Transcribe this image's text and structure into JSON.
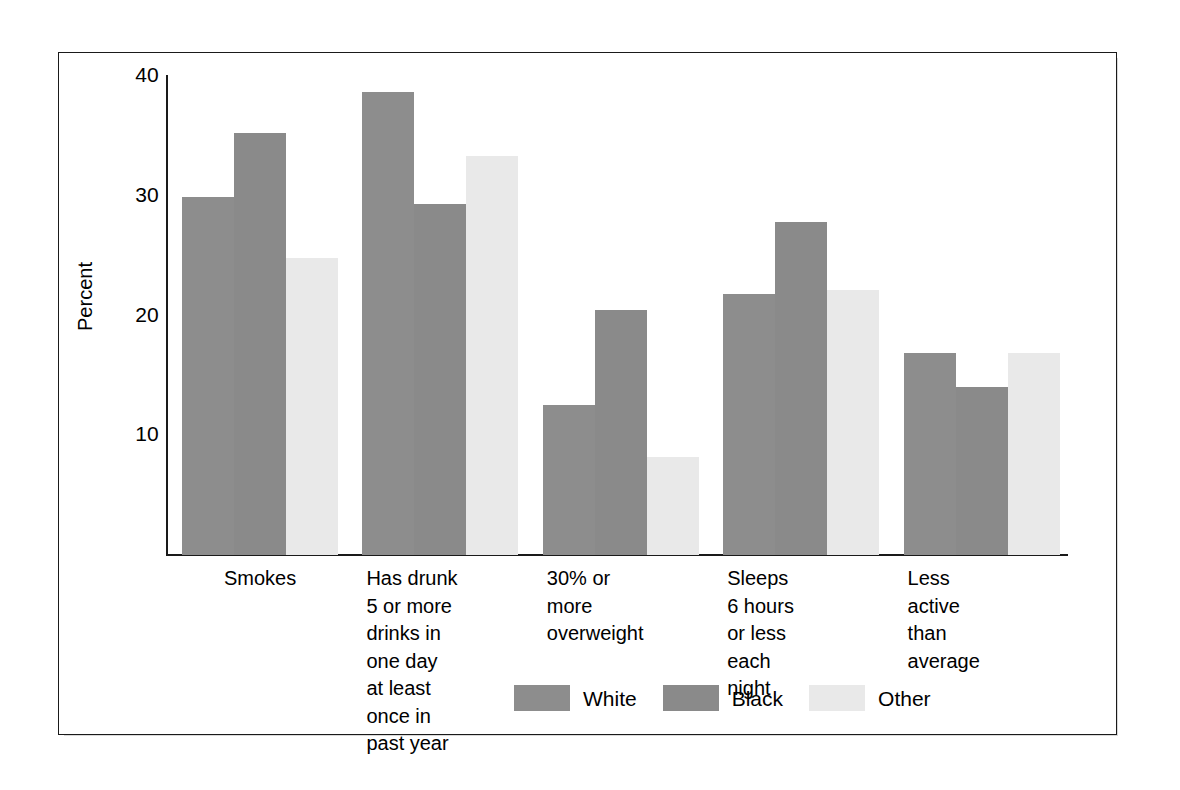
{
  "chart_data": {
    "type": "bar",
    "title": "",
    "subtitle": "",
    "xlabel": "",
    "ylabel": "Percent",
    "ylim": [
      0,
      40
    ],
    "yticks": [
      10,
      20,
      30,
      40
    ],
    "grid": false,
    "legend_position": "bottom-center",
    "categories": [
      "Smokes",
      "Has drunk\n5 or more\ndrinks in\none day\nat least\nonce in\npast year",
      "30% or\nmore\noverweight",
      "Sleeps\n6 hours\nor less\neach\nnight",
      "Less\nactive\nthan\naverage"
    ],
    "series": [
      {
        "name": "White",
        "color": "#8d8d8d",
        "values": [
          29.9,
          38.7,
          12.5,
          21.8,
          16.9
        ]
      },
      {
        "name": "Black",
        "color": "#8a8a8a",
        "values": [
          35.2,
          29.3,
          20.5,
          27.8,
          14.0
        ]
      },
      {
        "name": "Other",
        "color": "#e9e9e9",
        "values": [
          24.8,
          33.3,
          8.2,
          22.1,
          16.9
        ]
      }
    ]
  },
  "axis": {
    "y_title": "Percent",
    "y_tick_labels": [
      "40",
      "30",
      "20",
      "10"
    ]
  },
  "legend": {
    "items": [
      {
        "label": "White",
        "swatch": "white-swatch"
      },
      {
        "label": "Black",
        "swatch": "black-swatch"
      },
      {
        "label": "Other",
        "swatch": "other-swatch"
      }
    ]
  }
}
